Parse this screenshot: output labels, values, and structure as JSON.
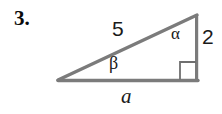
{
  "problem": {
    "number": "3."
  },
  "figure": {
    "type": "right-triangle-diagram",
    "stroke_color": "#7b7b7b",
    "background_color": "#ffffff",
    "vertices": {
      "left": [
        58,
        81
      ],
      "bottom_right": [
        197,
        81
      ],
      "apex": [
        197,
        15
      ]
    },
    "right_angle_marker": {
      "corner": "bottom-right",
      "size": 17
    },
    "labels": {
      "hypotenuse": "5",
      "vertical_leg": "2",
      "base_leg": "a",
      "angle_at_apex": "α",
      "angle_at_left": "β"
    }
  }
}
